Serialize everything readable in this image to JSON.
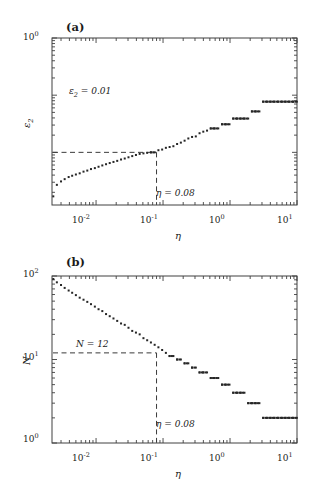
{
  "figure": {
    "background": "#ffffff",
    "marker_color": "#262626",
    "axis_color": "#404040",
    "dash_color": "#3a3a3a"
  },
  "panels": [
    {
      "tag": "(a)",
      "ylabel": "ε",
      "ylabel_sub": "2",
      "xlabel": "η",
      "xticks": [
        "10",
        "10",
        "10",
        "10"
      ],
      "xtick_exp": [
        "-2",
        "-1",
        "0",
        "1"
      ],
      "yticks": [
        "10"
      ],
      "ytick_exp": [
        "0"
      ],
      "annotations": [
        {
          "text": "ε",
          "sub": "2",
          "rest": " = 0.01"
        },
        {
          "text": "η = 0.08"
        }
      ]
    },
    {
      "tag": "(b)",
      "ylabel": "N",
      "xlabel": "η",
      "xticks": [
        "10",
        "10",
        "10",
        "10"
      ],
      "xtick_exp": [
        "-2",
        "-1",
        "0",
        "1"
      ],
      "yticks": [
        "10",
        "10",
        "10"
      ],
      "ytick_exp": [
        "2",
        "1",
        "0"
      ],
      "annotations": [
        {
          "text": "N = 12"
        },
        {
          "text": "η = 0.08"
        }
      ]
    }
  ],
  "chart_data": [
    {
      "type": "scatter",
      "title": "(a)",
      "xlabel": "η",
      "ylabel": "ε_2",
      "xscale": "log",
      "yscale": "log",
      "xlim": [
        0.0022,
        10.0
      ],
      "ylim": [
        0.0012,
        1.0
      ],
      "xticks": [
        0.01,
        0.1,
        1,
        10
      ],
      "yticks": [
        1
      ],
      "grid": false,
      "legend": null,
      "marker": "square",
      "reference_lines": [
        {
          "orientation": "horizontal",
          "value": 0.01,
          "label": "ε_2 = 0.01",
          "style": "dashed"
        },
        {
          "orientation": "vertical",
          "value": 0.08,
          "label": "η = 0.08",
          "style": "dashed"
        }
      ],
      "x": [
        0.0023,
        0.0026,
        0.003,
        0.0034,
        0.0039,
        0.0044,
        0.005,
        0.0057,
        0.0065,
        0.0074,
        0.0084,
        0.0096,
        0.0109,
        0.0124,
        0.0141,
        0.016,
        0.0182,
        0.0207,
        0.0236,
        0.0268,
        0.0305,
        0.0347,
        0.0394,
        0.0448,
        0.051,
        0.058,
        0.0659,
        0.075,
        0.0853,
        0.097,
        0.1103,
        0.1254,
        0.1427,
        0.1622,
        0.1845,
        0.2098,
        0.2386,
        0.2713,
        0.3086,
        0.3509,
        0.3991,
        0.4538,
        0.5161,
        0.587,
        0.6675,
        0.7591,
        0.8633,
        0.9818,
        1.1165,
        1.2697,
        1.444,
        1.6421,
        1.8674,
        2.1236,
        2.415,
        2.7463,
        3.1232,
        3.5518,
        4.0391,
        4.5933,
        5.2234,
        5.9402,
        6.7553,
        7.6822,
        8.7364,
        9.9353
      ],
      "y": [
        0.0017,
        0.0027,
        0.0031,
        0.0034,
        0.0037,
        0.0039,
        0.0041,
        0.0043,
        0.0046,
        0.0048,
        0.0051,
        0.0053,
        0.0056,
        0.0059,
        0.0062,
        0.0065,
        0.0068,
        0.0071,
        0.0075,
        0.0078,
        0.0082,
        0.0086,
        0.009,
        0.0094,
        0.0096,
        0.0098,
        0.01,
        0.01,
        0.0109,
        0.0112,
        0.012,
        0.0124,
        0.0128,
        0.014,
        0.0148,
        0.016,
        0.0175,
        0.0186,
        0.019,
        0.0216,
        0.023,
        0.024,
        0.0262,
        0.0262,
        0.0262,
        0.031,
        0.031,
        0.031,
        0.039,
        0.039,
        0.039,
        0.039,
        0.039,
        0.052,
        0.052,
        0.052,
        0.077,
        0.077,
        0.077,
        0.077,
        0.077,
        0.077,
        0.077,
        0.077,
        0.077,
        0.077
      ],
      "description": "Monotonically increasing staircase of epsilon_2 versus eta on log-log axes; smooth power-law-like rise at small eta, discrete plateaus at large eta."
    },
    {
      "type": "scatter",
      "title": "(b)",
      "xlabel": "η",
      "ylabel": "N",
      "xscale": "log",
      "yscale": "log",
      "xlim": [
        0.0022,
        10.0
      ],
      "ylim": [
        1.0,
        100.0
      ],
      "xticks": [
        0.01,
        0.1,
        1,
        10
      ],
      "yticks": [
        1,
        10,
        100
      ],
      "grid": false,
      "legend": null,
      "marker": "square",
      "reference_lines": [
        {
          "orientation": "horizontal",
          "value": 12,
          "label": "N = 12",
          "style": "dashed"
        },
        {
          "orientation": "vertical",
          "value": 0.08,
          "label": "η = 0.08",
          "style": "dashed"
        }
      ],
      "x": [
        0.0023,
        0.0026,
        0.003,
        0.0034,
        0.0039,
        0.0044,
        0.005,
        0.0057,
        0.0065,
        0.0074,
        0.0084,
        0.0096,
        0.0109,
        0.0124,
        0.0141,
        0.016,
        0.0182,
        0.0207,
        0.0236,
        0.0268,
        0.0305,
        0.0347,
        0.0394,
        0.0448,
        0.051,
        0.058,
        0.0659,
        0.075,
        0.0853,
        0.097,
        0.1103,
        0.1254,
        0.1427,
        0.1622,
        0.1845,
        0.2098,
        0.2386,
        0.2713,
        0.3086,
        0.3509,
        0.3991,
        0.4538,
        0.5161,
        0.587,
        0.6675,
        0.7591,
        0.8633,
        0.9818,
        1.1165,
        1.2697,
        1.444,
        1.6421,
        1.8674,
        2.1236,
        2.415,
        2.7463,
        3.1232,
        3.5518,
        4.0391,
        4.5933,
        5.2234,
        5.9402,
        6.7553,
        7.6822,
        8.7364,
        9.9353
      ],
      "y": [
        92,
        84,
        78,
        72,
        67,
        63,
        59,
        55,
        52,
        49,
        46,
        43,
        40,
        38,
        35,
        33,
        31,
        29,
        27,
        26,
        24,
        22,
        21,
        20,
        18,
        17,
        16,
        15,
        14,
        13,
        12,
        11,
        11,
        10,
        10,
        9,
        9,
        8,
        8,
        7,
        7,
        7,
        6,
        6,
        6,
        5,
        5,
        5,
        4,
        4,
        4,
        4,
        3,
        3,
        3,
        3,
        2,
        2,
        2,
        2,
        2,
        2,
        2,
        2,
        2,
        2
      ],
      "description": "Monotonically decreasing number of modes N versus eta on log-log axes; power-law decay from ~90 at small eta, flattening into integer plateaus (11,10,9,8,7,6,5,4,3,2) at large eta."
    }
  ]
}
